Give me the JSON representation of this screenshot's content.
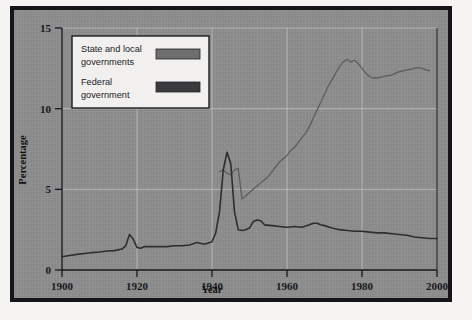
{
  "figure": {
    "background_color": "#8e8e8e",
    "frame_color": "#16161a",
    "page_color": "#f5f4f2"
  },
  "legend": {
    "position": "top-left",
    "background_color": "#f1f0ee",
    "border_color": "#1b1b1f",
    "entries": [
      {
        "label_line1": "State and local",
        "label_line2": "governments",
        "swatch_color": "#6e6e6e"
      },
      {
        "label_line1": "Federal",
        "label_line2": "government",
        "swatch_color": "#3b3b3d"
      }
    ]
  },
  "chart_data": {
    "type": "line",
    "title": "",
    "xlabel": "Year",
    "ylabel": "Percentage",
    "xlim": [
      1900,
      2000
    ],
    "ylim": [
      0,
      15
    ],
    "xticks": [
      1900,
      1920,
      1940,
      1960,
      1980,
      2000
    ],
    "yticks": [
      0,
      5,
      10,
      15
    ],
    "xtick_labels": [
      "1900",
      "1920",
      "1940",
      "1960",
      "1980",
      "2000"
    ],
    "ytick_labels": [
      "0",
      "5",
      "10",
      "15"
    ],
    "grid": true,
    "grid_color": "#c9c9c9",
    "legend_position": "upper left",
    "series": [
      {
        "name": "State and local governments",
        "color": "#5d5d5d",
        "line_width": 1.3,
        "x": [
          1942,
          1943,
          1944,
          1945,
          1946,
          1947,
          1948,
          1949,
          1950,
          1951,
          1952,
          1953,
          1954,
          1955,
          1956,
          1957,
          1958,
          1959,
          1960,
          1961,
          1962,
          1963,
          1964,
          1965,
          1966,
          1967,
          1968,
          1969,
          1970,
          1971,
          1972,
          1973,
          1974,
          1975,
          1976,
          1977,
          1978,
          1979,
          1980,
          1981,
          1982,
          1983,
          1984,
          1985,
          1986,
          1987,
          1988,
          1989,
          1990,
          1991,
          1992,
          1993,
          1994,
          1995,
          1996,
          1997,
          1998
        ],
        "y": [
          6.1,
          6.2,
          6.0,
          5.9,
          6.2,
          6.3,
          4.4,
          4.6,
          4.8,
          5.0,
          5.2,
          5.4,
          5.6,
          5.8,
          6.1,
          6.4,
          6.7,
          6.9,
          7.1,
          7.4,
          7.6,
          7.9,
          8.2,
          8.5,
          8.9,
          9.4,
          9.9,
          10.4,
          10.9,
          11.4,
          11.8,
          12.2,
          12.6,
          12.9,
          13.05,
          12.9,
          13.0,
          12.8,
          12.5,
          12.2,
          12.0,
          11.9,
          11.9,
          11.95,
          12.0,
          12.05,
          12.1,
          12.2,
          12.3,
          12.35,
          12.4,
          12.45,
          12.5,
          12.55,
          12.5,
          12.4,
          12.35
        ]
      },
      {
        "name": "Federal government",
        "color": "#2e2e31",
        "line_width": 1.6,
        "x": [
          1900,
          1902,
          1904,
          1906,
          1908,
          1910,
          1912,
          1914,
          1916,
          1917,
          1918,
          1919,
          1920,
          1921,
          1922,
          1923,
          1924,
          1926,
          1928,
          1930,
          1932,
          1934,
          1936,
          1938,
          1940,
          1941,
          1942,
          1943,
          1944,
          1945,
          1946,
          1947,
          1948,
          1949,
          1950,
          1951,
          1952,
          1953,
          1954,
          1956,
          1958,
          1960,
          1962,
          1964,
          1966,
          1967,
          1968,
          1969,
          1970,
          1972,
          1974,
          1976,
          1978,
          1980,
          1982,
          1984,
          1986,
          1988,
          1990,
          1992,
          1994,
          1996,
          1998,
          2000
        ],
        "y": [
          0.82,
          0.9,
          0.97,
          1.02,
          1.08,
          1.12,
          1.18,
          1.2,
          1.3,
          1.5,
          2.2,
          1.9,
          1.4,
          1.35,
          1.45,
          1.45,
          1.45,
          1.45,
          1.45,
          1.5,
          1.5,
          1.55,
          1.7,
          1.6,
          1.75,
          2.3,
          3.6,
          6.2,
          7.3,
          6.6,
          3.6,
          2.5,
          2.45,
          2.5,
          2.6,
          3.0,
          3.1,
          3.05,
          2.8,
          2.75,
          2.7,
          2.65,
          2.7,
          2.65,
          2.8,
          2.9,
          2.9,
          2.8,
          2.75,
          2.6,
          2.5,
          2.45,
          2.4,
          2.4,
          2.35,
          2.3,
          2.3,
          2.25,
          2.2,
          2.15,
          2.05,
          2.0,
          1.95,
          1.95
        ]
      }
    ]
  }
}
